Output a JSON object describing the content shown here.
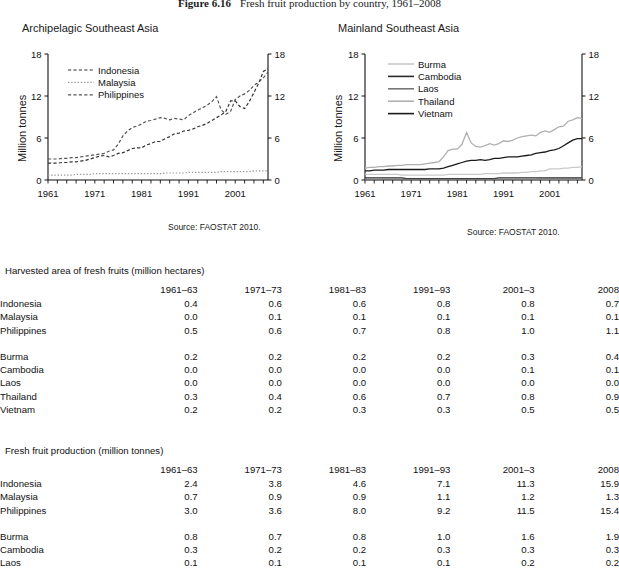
{
  "figure": {
    "number": "Figure 6.16",
    "caption": "Fresh fruit production by country, 1961–2008"
  },
  "panels": [
    {
      "id": "archipelagic",
      "title": "Archipelagic Southeast Asia",
      "ylabel": "Million tonnes",
      "source": "Source: FAOSTAT 2010."
    },
    {
      "id": "mainland",
      "title": "Mainland Southeast Asia",
      "ylabel": "Million tonnes",
      "source": "Source: FAOSTAT 2010."
    }
  ],
  "chart_data": [
    {
      "type": "line",
      "title": "Archipelagic Southeast Asia",
      "xlabel": "",
      "ylabel": "Million tonnes",
      "xlim": [
        1961,
        2008
      ],
      "ylim": [
        0,
        18
      ],
      "yticks": [
        0,
        6,
        12,
        18
      ],
      "xticks": [
        1961,
        1971,
        1981,
        1991,
        2001
      ],
      "grid": false,
      "legend_position": "upper-left-inside",
      "dual_axis": true,
      "x": [
        1961,
        1962,
        1963,
        1964,
        1965,
        1966,
        1967,
        1968,
        1969,
        1970,
        1971,
        1972,
        1973,
        1974,
        1975,
        1976,
        1977,
        1978,
        1979,
        1980,
        1981,
        1982,
        1983,
        1984,
        1985,
        1986,
        1987,
        1988,
        1989,
        1990,
        1991,
        1992,
        1993,
        1994,
        1995,
        1996,
        1997,
        1998,
        1999,
        2000,
        2001,
        2002,
        2003,
        2004,
        2005,
        2006,
        2007,
        2008
      ],
      "series": [
        {
          "name": "Indonesia",
          "style": "dashed",
          "color": "#333333",
          "values": [
            2.4,
            2.4,
            2.4,
            2.5,
            2.5,
            2.6,
            2.6,
            2.7,
            2.8,
            3.0,
            3.2,
            3.4,
            3.5,
            3.3,
            3.5,
            3.8,
            3.9,
            4.2,
            4.5,
            4.6,
            4.6,
            5.0,
            5.2,
            5.5,
            5.5,
            5.9,
            6.2,
            6.6,
            6.7,
            7.0,
            7.1,
            7.3,
            7.6,
            7.8,
            8.1,
            8.5,
            8.9,
            9.3,
            9.8,
            11.3,
            11.3,
            10.5,
            10.2,
            11.2,
            12.5,
            13.8,
            15.5,
            15.9
          ]
        },
        {
          "name": "Malaysia",
          "style": "dotted",
          "color": "#999999",
          "values": [
            0.7,
            0.7,
            0.7,
            0.7,
            0.7,
            0.7,
            0.8,
            0.8,
            0.8,
            0.8,
            0.9,
            0.9,
            0.9,
            0.9,
            0.9,
            0.9,
            0.9,
            0.9,
            0.9,
            0.9,
            0.9,
            0.9,
            0.9,
            0.9,
            0.9,
            1.0,
            1.0,
            1.0,
            1.0,
            1.0,
            1.1,
            1.1,
            1.1,
            1.1,
            1.1,
            1.1,
            1.1,
            1.2,
            1.2,
            1.2,
            1.2,
            1.2,
            1.2,
            1.2,
            1.3,
            1.3,
            1.3,
            1.3
          ]
        },
        {
          "name": "Philippines",
          "style": "dashed",
          "color": "#555555",
          "values": [
            3.0,
            3.0,
            3.0,
            3.1,
            3.1,
            3.2,
            3.2,
            3.3,
            3.4,
            3.5,
            3.6,
            3.7,
            3.8,
            4.1,
            4.3,
            5.1,
            6.3,
            7.0,
            7.5,
            7.7,
            8.0,
            8.4,
            8.5,
            8.7,
            8.9,
            8.8,
            8.6,
            8.8,
            8.7,
            8.6,
            9.2,
            9.6,
            10.0,
            10.3,
            10.7,
            11.2,
            11.9,
            10.0,
            9.4,
            9.8,
            11.5,
            12.0,
            12.3,
            12.8,
            13.5,
            14.0,
            14.6,
            15.4
          ]
        }
      ]
    },
    {
      "type": "line",
      "title": "Mainland Southeast Asia",
      "xlabel": "",
      "ylabel": "Million tonnes",
      "xlim": [
        1961,
        2008
      ],
      "ylim": [
        0,
        18
      ],
      "yticks": [
        0,
        6,
        12,
        18
      ],
      "xticks": [
        1961,
        1971,
        1981,
        1991,
        2001
      ],
      "grid": false,
      "legend_position": "upper-left-inside",
      "dual_axis": true,
      "x": [
        1961,
        1962,
        1963,
        1964,
        1965,
        1966,
        1967,
        1968,
        1969,
        1970,
        1971,
        1972,
        1973,
        1974,
        1975,
        1976,
        1977,
        1978,
        1979,
        1980,
        1981,
        1982,
        1983,
        1984,
        1985,
        1986,
        1987,
        1988,
        1989,
        1990,
        1991,
        1992,
        1993,
        1994,
        1995,
        1996,
        1997,
        1998,
        1999,
        2000,
        2001,
        2002,
        2003,
        2004,
        2005,
        2006,
        2007,
        2008
      ],
      "series": [
        {
          "name": "Burma",
          "style": "solid",
          "color": "#c9c9c9",
          "values": [
            0.8,
            0.8,
            0.8,
            0.8,
            0.8,
            0.8,
            0.8,
            0.8,
            0.7,
            0.7,
            0.7,
            0.7,
            0.7,
            0.7,
            0.7,
            0.7,
            0.7,
            0.7,
            0.8,
            0.8,
            0.8,
            0.8,
            0.8,
            0.8,
            0.8,
            0.8,
            0.9,
            0.9,
            0.9,
            0.9,
            1.0,
            1.0,
            1.0,
            1.0,
            1.1,
            1.1,
            1.2,
            1.2,
            1.3,
            1.3,
            1.6,
            1.6,
            1.6,
            1.7,
            1.7,
            1.8,
            1.8,
            1.9
          ]
        },
        {
          "name": "Cambodia",
          "style": "solid",
          "color": "#2b2b2b",
          "values": [
            0.3,
            0.3,
            0.3,
            0.3,
            0.3,
            0.3,
            0.3,
            0.3,
            0.3,
            0.2,
            0.2,
            0.2,
            0.2,
            0.2,
            0.2,
            0.2,
            0.2,
            0.2,
            0.2,
            0.2,
            0.2,
            0.2,
            0.2,
            0.2,
            0.2,
            0.2,
            0.2,
            0.2,
            0.2,
            0.3,
            0.3,
            0.3,
            0.3,
            0.3,
            0.3,
            0.3,
            0.3,
            0.3,
            0.3,
            0.3,
            0.3,
            0.3,
            0.3,
            0.3,
            0.3,
            0.3,
            0.3,
            0.3
          ]
        },
        {
          "name": "Laos",
          "style": "solid",
          "color": "#777777",
          "values": [
            0.1,
            0.1,
            0.1,
            0.1,
            0.1,
            0.1,
            0.1,
            0.1,
            0.1,
            0.1,
            0.1,
            0.1,
            0.1,
            0.1,
            0.1,
            0.1,
            0.1,
            0.1,
            0.1,
            0.1,
            0.1,
            0.1,
            0.1,
            0.1,
            0.1,
            0.1,
            0.1,
            0.1,
            0.1,
            0.1,
            0.1,
            0.1,
            0.1,
            0.1,
            0.1,
            0.1,
            0.1,
            0.1,
            0.2,
            0.2,
            0.2,
            0.2,
            0.2,
            0.2,
            0.2,
            0.2,
            0.2,
            0.2
          ]
        },
        {
          "name": "Thailand",
          "style": "solid",
          "color": "#b0b0b0",
          "values": [
            1.7,
            1.8,
            1.8,
            1.9,
            1.9,
            2.0,
            2.0,
            2.1,
            2.1,
            2.2,
            2.2,
            2.2,
            2.2,
            2.3,
            2.4,
            2.5,
            2.6,
            3.3,
            4.2,
            4.4,
            4.4,
            5.1,
            6.8,
            5.3,
            4.8,
            4.7,
            4.9,
            5.2,
            5.0,
            5.2,
            5.6,
            5.5,
            5.7,
            6.0,
            6.2,
            6.3,
            6.4,
            6.3,
            6.8,
            7.0,
            6.8,
            7.2,
            7.6,
            7.7,
            8.4,
            8.6,
            8.9,
            8.8
          ]
        },
        {
          "name": "Vietnam",
          "style": "solid",
          "color": "#1a1a1a",
          "values": [
            1.3,
            1.3,
            1.4,
            1.4,
            1.4,
            1.5,
            1.5,
            1.5,
            1.5,
            1.5,
            1.5,
            1.5,
            1.5,
            1.5,
            1.6,
            1.6,
            1.6,
            1.7,
            1.9,
            2.1,
            2.3,
            2.5,
            2.7,
            2.8,
            2.8,
            2.9,
            2.8,
            2.9,
            3.1,
            3.1,
            3.2,
            3.3,
            3.3,
            3.3,
            3.4,
            3.5,
            3.6,
            3.8,
            3.9,
            4.0,
            4.2,
            4.3,
            4.5,
            4.9,
            5.3,
            5.7,
            5.9,
            5.9
          ]
        }
      ]
    }
  ],
  "tables": [
    {
      "caption": "Harvested area of fresh fruits (million hectares)",
      "columns": [
        "1961–63",
        "1971–73",
        "1981–83",
        "1991–93",
        "2001–3",
        "2008"
      ],
      "groups": [
        {
          "rows": [
            {
              "name": "Indonesia",
              "values": [
                "0.4",
                "0.6",
                "0.6",
                "0.8",
                "0.8",
                "0.7"
              ]
            },
            {
              "name": "Malaysia",
              "values": [
                "0.0",
                "0.1",
                "0.1",
                "0.1",
                "0.1",
                "0.1"
              ]
            },
            {
              "name": "Philippines",
              "values": [
                "0.5",
                "0.6",
                "0.7",
                "0.8",
                "1.0",
                "1.1"
              ]
            }
          ]
        },
        {
          "rows": [
            {
              "name": "Burma",
              "values": [
                "0.2",
                "0.2",
                "0.2",
                "0.2",
                "0.3",
                "0.4"
              ]
            },
            {
              "name": "Cambodia",
              "values": [
                "0.0",
                "0.0",
                "0.0",
                "0.0",
                "0.1",
                "0.1"
              ]
            },
            {
              "name": "Laos",
              "values": [
                "0.0",
                "0.0",
                "0.0",
                "0.0",
                "0.0",
                "0.0"
              ]
            },
            {
              "name": "Thailand",
              "values": [
                "0.3",
                "0.4",
                "0.6",
                "0.7",
                "0.8",
                "0.9"
              ]
            },
            {
              "name": "Vietnam",
              "values": [
                "0.2",
                "0.2",
                "0.3",
                "0.3",
                "0.5",
                "0.5"
              ]
            }
          ]
        }
      ]
    },
    {
      "caption": "Fresh fruit production (million tonnes)",
      "columns": [
        "1961–63",
        "1971–73",
        "1981–83",
        "1991–93",
        "2001–3",
        "2008"
      ],
      "groups": [
        {
          "rows": [
            {
              "name": "Indonesia",
              "values": [
                "2.4",
                "3.8",
                "4.6",
                "7.1",
                "11.3",
                "15.9"
              ]
            },
            {
              "name": "Malaysia",
              "values": [
                "0.7",
                "0.9",
                "0.9",
                "1.1",
                "1.2",
                "1.3"
              ]
            },
            {
              "name": "Philippines",
              "values": [
                "3.0",
                "3.6",
                "8.0",
                "9.2",
                "11.5",
                "15.4"
              ]
            }
          ]
        },
        {
          "rows": [
            {
              "name": "Burma",
              "values": [
                "0.8",
                "0.7",
                "0.8",
                "1.0",
                "1.6",
                "1.9"
              ]
            },
            {
              "name": "Cambodia",
              "values": [
                "0.3",
                "0.2",
                "0.2",
                "0.3",
                "0.3",
                "0.3"
              ]
            },
            {
              "name": "Laos",
              "values": [
                "0.1",
                "0.1",
                "0.1",
                "0.1",
                "0.2",
                "0.2"
              ]
            }
          ]
        }
      ]
    }
  ]
}
